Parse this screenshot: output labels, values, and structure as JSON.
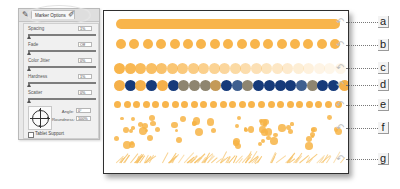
{
  "panel": {
    "tab_active_label": "Marker Options",
    "tab_icons": [
      "brush-tool-icon",
      "pencil-icon"
    ],
    "options": [
      {
        "label": "Spacing",
        "value": "1%"
      },
      {
        "label": "Fade",
        "value": "Off"
      },
      {
        "label": "Color Jitter",
        "value": "0%"
      },
      {
        "label": "Hardness",
        "value": "1%"
      },
      {
        "label": "Scatter",
        "value": "0%"
      }
    ],
    "angle": {
      "label": "Angle:",
      "value": "0°"
    },
    "roundness": {
      "label": "Roundness:",
      "value": "100%"
    },
    "tablet_support": {
      "label": "Tablet Support",
      "checked": false
    }
  },
  "canvas": {
    "accent_color": "#f8b54c",
    "rows": [
      {
        "id": "a",
        "type": "continuous-stroke"
      },
      {
        "id": "b",
        "type": "spaced-dots",
        "count": 17
      },
      {
        "id": "c",
        "type": "fading-dots",
        "count": 22
      },
      {
        "id": "d",
        "type": "color-jitter-dots",
        "colors": [
          "#f5b04a",
          "#163a7a",
          "#f5b04a",
          "#163a7a",
          "#f5b04a",
          "#163a7a",
          "#8e8570",
          "#8e8570",
          "#8e8570",
          "#c49a58",
          "#163a7a",
          "#3f5f8f",
          "#8e8570",
          "#163a7a",
          "#163a7a",
          "#163a7a",
          "#163a7a",
          "#3f5f8f",
          "#8e8570",
          "#163a7a",
          "#163a7a",
          "#f5b04a"
        ]
      },
      {
        "id": "e",
        "type": "soft-small-dots",
        "count": 24
      },
      {
        "id": "f",
        "type": "scattered-dots"
      },
      {
        "id": "g",
        "type": "textured-strokes"
      }
    ]
  },
  "callouts": [
    "a",
    "b",
    "c",
    "d",
    "e",
    "f",
    "g"
  ]
}
